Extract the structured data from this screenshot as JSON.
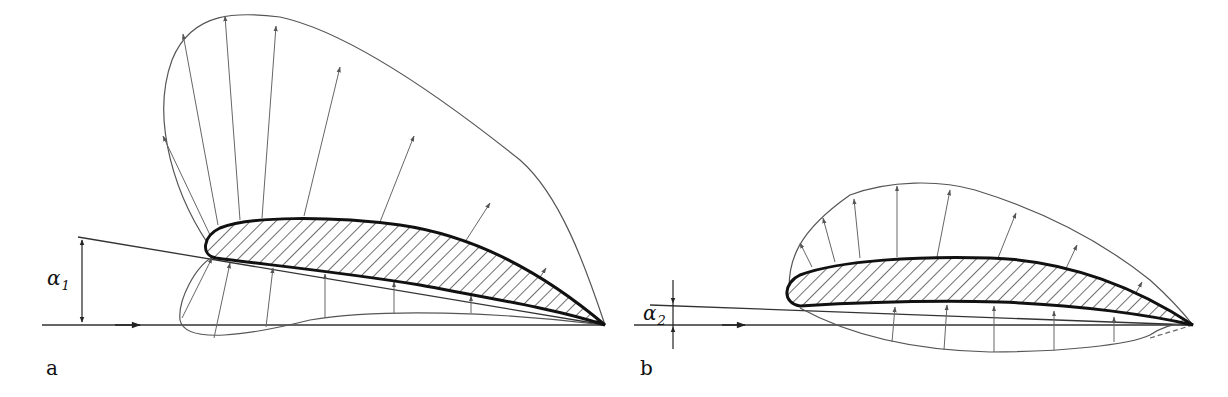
{
  "figure": {
    "panel_a": {
      "label": "a",
      "angle_symbol": "α",
      "angle_subscript": "1",
      "description": "Pressure distribution on airfoil at larger angle of attack α1"
    },
    "panel_b": {
      "label": "b",
      "angle_symbol": "α",
      "angle_subscript": "2",
      "description": "Pressure distribution on airfoil at smaller angle of attack α2"
    },
    "colors": {
      "outline": "#111111",
      "envelope": "#555555",
      "vectors": "#666666",
      "background": "#ffffff"
    }
  }
}
